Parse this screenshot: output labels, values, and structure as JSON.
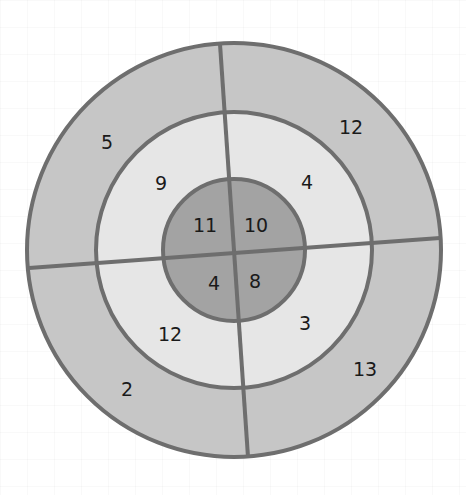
{
  "diagram": {
    "type": "target-rings",
    "center": [
      234,
      250
    ],
    "radii": {
      "outer": 208,
      "middle": 138,
      "inner": 71
    },
    "colors": {
      "outer_ring": "#c6c6c6",
      "middle_ring": "#e6e6e6",
      "inner_ring": "#a3a3a3",
      "stroke": "#6e6e6e"
    },
    "rings": {
      "outer": {
        "top_left": "5",
        "top_right": "12",
        "bottom_left": "2",
        "bottom_right": "13"
      },
      "middle": {
        "top_left": "9",
        "top_right": "4",
        "bottom_left": "12",
        "bottom_right": "3"
      },
      "inner": {
        "top_left": "11",
        "top_right": "10",
        "bottom_left": "4",
        "bottom_right": "8"
      }
    }
  }
}
